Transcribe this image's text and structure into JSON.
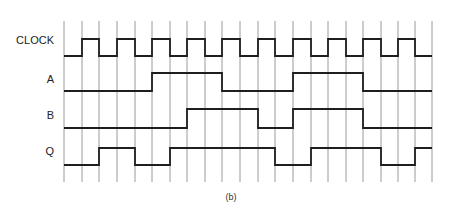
{
  "figure": {
    "caption": "(b)",
    "grid_color": "#9a9a9a",
    "signal_color": "#1e1e1e"
  },
  "timing": {
    "grid_x": [
      64,
      82,
      99,
      117,
      135,
      152,
      170,
      187,
      205,
      222,
      240,
      258,
      275,
      293,
      311,
      328,
      346,
      363,
      381,
      398,
      415,
      432
    ],
    "grid_top": 21,
    "grid_bottom": 182,
    "signals": [
      {
        "name": "CLOCK",
        "label_y": 40,
        "high_y": 39,
        "low_y": 56,
        "levels": [
          0,
          1,
          0,
          1,
          0,
          1,
          0,
          1,
          0,
          1,
          0,
          1,
          0,
          1,
          0,
          1,
          0,
          1,
          0,
          1,
          0
        ]
      },
      {
        "name": "A",
        "label_y": 79,
        "high_y": 73,
        "low_y": 91,
        "levels": [
          0,
          0,
          0,
          0,
          0,
          1,
          1,
          1,
          1,
          0,
          0,
          0,
          0,
          1,
          1,
          1,
          1,
          0,
          0,
          0,
          0
        ]
      },
      {
        "name": "B",
        "label_y": 115,
        "high_y": 109,
        "low_y": 128,
        "levels": [
          0,
          0,
          0,
          0,
          0,
          0,
          0,
          1,
          1,
          1,
          1,
          0,
          0,
          1,
          1,
          1,
          1,
          0,
          0,
          0,
          0
        ]
      },
      {
        "name": "Q",
        "label_y": 151,
        "high_y": 148,
        "low_y": 165,
        "levels": [
          0,
          0,
          1,
          1,
          0,
          0,
          1,
          1,
          1,
          1,
          1,
          1,
          0,
          0,
          1,
          1,
          1,
          1,
          0,
          0,
          1
        ]
      }
    ]
  }
}
